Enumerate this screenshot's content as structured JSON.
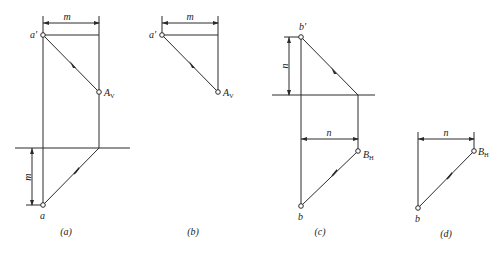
{
  "diagrams": [
    {
      "caption": "(a)",
      "labels": {
        "dim_top": "m",
        "dim_left": "m",
        "point_top": "a'",
        "point_trace": "A",
        "trace_sub": "V",
        "point_bottom": "a"
      }
    },
    {
      "caption": "(b)",
      "labels": {
        "dim_top": "m",
        "point_top": "a'",
        "point_trace": "A",
        "trace_sub": "V"
      }
    },
    {
      "caption": "(c)",
      "labels": {
        "dim_left": "n",
        "dim_mid": "n",
        "point_top": "b'",
        "point_trace": "B",
        "trace_sub": "H",
        "point_bottom": "b"
      }
    },
    {
      "caption": "(d)",
      "labels": {
        "dim_top": "n",
        "point_trace": "B",
        "trace_sub": "H",
        "point_bottom": "b"
      }
    }
  ],
  "colors": {
    "line": "#2a2a2a",
    "background": "#ffffff"
  }
}
